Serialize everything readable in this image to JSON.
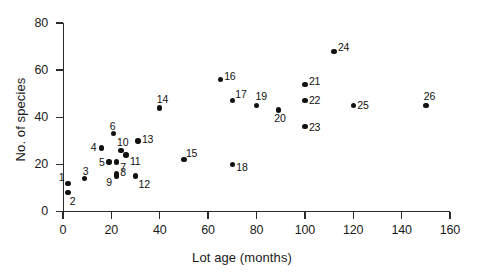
{
  "chart_data": {
    "type": "scatter",
    "title": "",
    "xlabel": "Lot age (months)",
    "ylabel": "No. of species",
    "xlim": [
      0,
      160
    ],
    "ylim": [
      0,
      80
    ],
    "xticks": [
      0,
      20,
      40,
      60,
      80,
      100,
      120,
      140,
      160
    ],
    "yticks": [
      0,
      20,
      40,
      60,
      80
    ],
    "grid": false,
    "legend": "none",
    "point_color": "#111111",
    "axis_color": "#2b2b2b",
    "points": [
      {
        "label": "1",
        "x": 2,
        "y": 12,
        "lx": -9,
        "ly": -11
      },
      {
        "label": "2",
        "x": 2,
        "y": 8,
        "lx": 2,
        "ly": 3
      },
      {
        "label": "3",
        "x": 9,
        "y": 14,
        "lx": -2,
        "ly": -13
      },
      {
        "label": "4",
        "x": 16,
        "y": 27,
        "lx": -11,
        "ly": -6
      },
      {
        "label": "5",
        "x": 19,
        "y": 21,
        "lx": -10,
        "ly": -5
      },
      {
        "label": "6",
        "x": 21,
        "y": 33,
        "lx": -4,
        "ly": -13
      },
      {
        "label": "7",
        "x": 22,
        "y": 21,
        "lx": 4,
        "ly": 0
      },
      {
        "label": "8",
        "x": 22,
        "y": 16,
        "lx": 4,
        "ly": -7
      },
      {
        "label": "9",
        "x": 22,
        "y": 15,
        "lx": -10,
        "ly": 1
      },
      {
        "label": "10",
        "x": 24,
        "y": 26,
        "lx": -4,
        "ly": -13
      },
      {
        "label": "11",
        "x": 26,
        "y": 24,
        "lx": 4,
        "ly": 1
      },
      {
        "label": "12",
        "x": 30,
        "y": 15,
        "lx": 3,
        "ly": 3
      },
      {
        "label": "13",
        "x": 31,
        "y": 30,
        "lx": 4,
        "ly": -7
      },
      {
        "label": "14",
        "x": 40,
        "y": 44,
        "lx": -3,
        "ly": -14
      },
      {
        "label": "15",
        "x": 50,
        "y": 22,
        "lx": 2,
        "ly": -12
      },
      {
        "label": "16",
        "x": 65,
        "y": 56,
        "lx": 4,
        "ly": -9
      },
      {
        "label": "17",
        "x": 70,
        "y": 47,
        "lx": 3,
        "ly": -12
      },
      {
        "label": "18",
        "x": 70,
        "y": 20,
        "lx": 4,
        "ly": -2
      },
      {
        "label": "19",
        "x": 80,
        "y": 45,
        "lx": -1,
        "ly": -14
      },
      {
        "label": "20",
        "x": 89,
        "y": 43,
        "lx": -4,
        "ly": 3
      },
      {
        "label": "21",
        "x": 100,
        "y": 54,
        "lx": 4,
        "ly": -8
      },
      {
        "label": "22",
        "x": 100,
        "y": 47,
        "lx": 4,
        "ly": -6
      },
      {
        "label": "23",
        "x": 100,
        "y": 36,
        "lx": 4,
        "ly": -5
      },
      {
        "label": "24",
        "x": 112,
        "y": 68,
        "lx": 4,
        "ly": -9
      },
      {
        "label": "25",
        "x": 120,
        "y": 45,
        "lx": 4,
        "ly": -5
      },
      {
        "label": "26",
        "x": 150,
        "y": 45,
        "lx": -2,
        "ly": -14
      }
    ]
  }
}
